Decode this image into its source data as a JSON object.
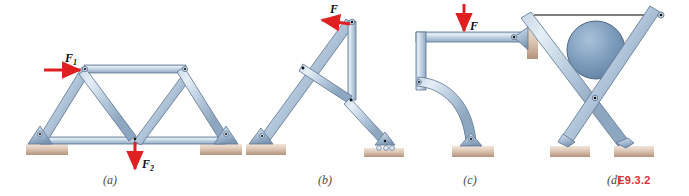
{
  "figure": {
    "id_label": "E9.3.2",
    "id_color": "#e03030",
    "background": "#ffffff",
    "width": 689,
    "height": 196
  },
  "style": {
    "member_fill_light": "#d6e2ee",
    "member_fill_mid": "#a9bfd4",
    "member_fill_dark": "#8aa4bd",
    "member_stroke": "#5c7490",
    "cylinder_fill": "#7d9cbb",
    "cylinder_stroke": "#4e6885",
    "ground_fill_light": "#efe0d6",
    "ground_fill_dark": "#b99a84",
    "arrow_color": "#e02020",
    "pin_dot": "#111111",
    "cable_color": "#555555",
    "label_color": "#4a4a4a"
  },
  "panels": [
    {
      "key": "a",
      "label": "(a)",
      "type": "truss",
      "caption_x": 110,
      "caption_y": 184,
      "forces": [
        {
          "name": "F1",
          "label": "F",
          "subscript": "1",
          "direction": "right",
          "label_x": 66,
          "label_y": 62
        },
        {
          "name": "F2",
          "label": "F",
          "subscript": "2",
          "direction": "down",
          "label_x": 136,
          "label_y": 166
        }
      ],
      "supports": [
        "pin",
        "pin"
      ]
    },
    {
      "key": "b",
      "label": "(b)",
      "type": "frame",
      "caption_x": 325,
      "caption_y": 184,
      "forces": [
        {
          "name": "F",
          "label": "F",
          "subscript": "",
          "direction": "left",
          "label_x": 333,
          "label_y": 14
        }
      ],
      "supports": [
        "pin",
        "roller"
      ]
    },
    {
      "key": "c",
      "label": "(c)",
      "type": "curved-frame",
      "caption_x": 470,
      "caption_y": 184,
      "forces": [
        {
          "name": "F",
          "label": "F",
          "subscript": "",
          "direction": "down",
          "label_x": 472,
          "label_y": 30
        }
      ],
      "supports": [
        "wall-pin",
        "pin"
      ]
    },
    {
      "key": "d",
      "label": "(d)",
      "type": "scissor-with-cylinder",
      "caption_x": 614,
      "caption_y": 184,
      "forces": [],
      "supports": [
        "ground-block",
        "ground-block"
      ],
      "has_cylinder": true,
      "has_cable": true
    }
  ]
}
